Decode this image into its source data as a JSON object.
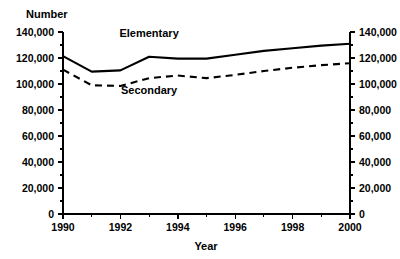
{
  "chart_data": {
    "type": "line",
    "title": "",
    "xlabel": "Year",
    "ylabel": "Number",
    "x": [
      1990,
      1991,
      1992,
      1993,
      1994,
      1995,
      1996,
      1997,
      1998,
      1999,
      2000
    ],
    "xlim": [
      1990,
      2000
    ],
    "ylim": [
      0,
      140000
    ],
    "grid": false,
    "legend_position": "inline-labels",
    "x_tick_labels": [
      "1990",
      "1992",
      "1994",
      "1996",
      "1998",
      "2000"
    ],
    "x_tick_values": [
      1990,
      1992,
      1994,
      1996,
      1998,
      2000
    ],
    "x_minor_tick_values": [
      1991,
      1993,
      1995,
      1997,
      1999
    ],
    "y_tick_labels": [
      "0",
      "20,000",
      "40,000",
      "60,000",
      "80,000",
      "100,000",
      "120,000",
      "140,000"
    ],
    "y_tick_values": [
      0,
      20000,
      40000,
      60000,
      80000,
      100000,
      120000,
      140000
    ],
    "y_minor_tick_values": [
      10000,
      30000,
      50000,
      70000,
      90000,
      110000,
      130000
    ],
    "right_axis_tick_labels": [
      "0",
      "20,000",
      "40,000",
      "60,000",
      "80,000",
      "100,000",
      "120,000",
      "140,000"
    ],
    "series": [
      {
        "name": "Elementary",
        "style": "solid",
        "label_x": 1993.0,
        "label_y": 136000,
        "values": [
          121500,
          109500,
          110500,
          121000,
          119500,
          119500,
          122500,
          125500,
          127500,
          129500,
          131000
        ]
      },
      {
        "name": "Secondary",
        "style": "dashed",
        "label_x": 1993.0,
        "label_y": 92000,
        "values": [
          111000,
          99000,
          98500,
          104500,
          106500,
          104500,
          107000,
          110000,
          112500,
          114500,
          116000
        ]
      }
    ]
  }
}
